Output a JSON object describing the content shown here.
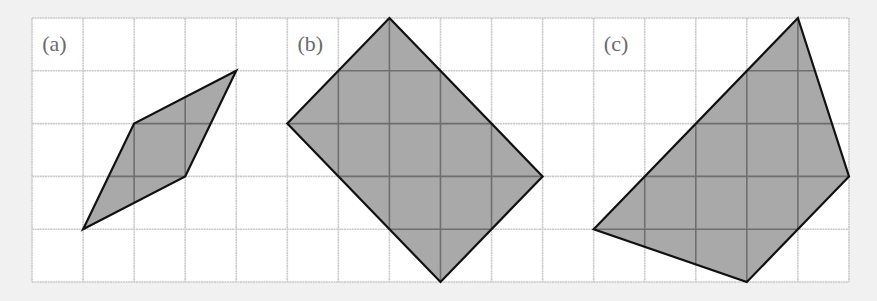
{
  "grid": {
    "origin_x": 32,
    "origin_y": 18,
    "cell_w": 51.06,
    "cell_h": 52.8,
    "cols": 16,
    "rows": 5,
    "cell_fill": "#ffffff",
    "line_color": "#c9c9c9",
    "inner_line_color": "#6f6f6f"
  },
  "colors": {
    "shape_fill": "#a9a9a9",
    "shape_stroke": "#111111",
    "background": "#f1f1f1"
  },
  "panels": [
    {
      "label": "(a)",
      "label_pos": [
        0.2,
        0.62
      ],
      "vertices": [
        [
          1,
          4
        ],
        [
          2,
          2
        ],
        [
          4,
          1
        ],
        [
          3,
          3
        ]
      ]
    },
    {
      "label": "(b)",
      "label_pos": [
        5.2,
        0.62
      ],
      "vertices": [
        [
          7,
          0
        ],
        [
          10,
          3
        ],
        [
          8,
          5
        ],
        [
          5,
          2
        ]
      ]
    },
    {
      "label": "(c)",
      "label_pos": [
        11.2,
        0.62
      ],
      "vertices": [
        [
          15,
          0
        ],
        [
          16,
          3
        ],
        [
          14,
          5
        ],
        [
          11,
          4
        ]
      ]
    }
  ]
}
